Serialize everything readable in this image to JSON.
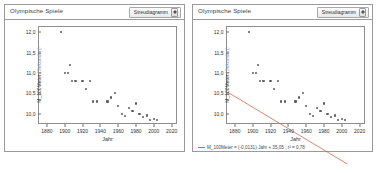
{
  "panels": [
    {
      "title": "Olympische Spiele",
      "plot_type": "Streudiagramm",
      "has_regression": false
    },
    {
      "title": "Olympische Spiele",
      "plot_type": "Streudiagramm",
      "has_regression": true,
      "equation": "M_100Meter = (-0,0131)·Jahr + 35,05 ; r² = 0,78"
    }
  ],
  "chart_data": {
    "type": "scatter",
    "title": "Olympische Spiele",
    "xlabel": "Jahr",
    "ylabel": "M_100Meter",
    "ylabel_unit": "(Sekunden)",
    "xlim": [
      1870,
      2026
    ],
    "ylim": [
      9.75,
      12.15
    ],
    "grid": false,
    "legend_position": "bottom-left",
    "xticks": [
      1880,
      1900,
      1920,
      1940,
      1960,
      1980,
      2000,
      2020
    ],
    "xticklabels": [
      "1880",
      "1900",
      "1920",
      "1940",
      "1960",
      "1980",
      "2000",
      "2020"
    ],
    "yticks": [
      10.0,
      10.5,
      11.0,
      11.5,
      12.0
    ],
    "yticklabels": [
      "10,0",
      "10,5",
      "11,0",
      "11,5",
      "12,0"
    ],
    "marker_color": "#5d5d5d",
    "line_color": "#d06a4c",
    "points": [
      {
        "x": 1896,
        "y": 12.0
      },
      {
        "x": 1900,
        "y": 11.0
      },
      {
        "x": 1904,
        "y": 11.0
      },
      {
        "x": 1906,
        "y": 11.2
      },
      {
        "x": 1908,
        "y": 10.8
      },
      {
        "x": 1912,
        "y": 10.8
      },
      {
        "x": 1920,
        "y": 10.8
      },
      {
        "x": 1924,
        "y": 10.6
      },
      {
        "x": 1928,
        "y": 10.8
      },
      {
        "x": 1932,
        "y": 10.3
      },
      {
        "x": 1936,
        "y": 10.3
      },
      {
        "x": 1948,
        "y": 10.3
      },
      {
        "x": 1952,
        "y": 10.4
      },
      {
        "x": 1956,
        "y": 10.5
      },
      {
        "x": 1960,
        "y": 10.2
      },
      {
        "x": 1964,
        "y": 10.0
      },
      {
        "x": 1968,
        "y": 9.95
      },
      {
        "x": 1972,
        "y": 10.14
      },
      {
        "x": 1976,
        "y": 10.06
      },
      {
        "x": 1980,
        "y": 10.25
      },
      {
        "x": 1984,
        "y": 9.99
      },
      {
        "x": 1988,
        "y": 9.92
      },
      {
        "x": 1992,
        "y": 9.96
      },
      {
        "x": 1996,
        "y": 9.84
      },
      {
        "x": 2000,
        "y": 9.87
      },
      {
        "x": 2004,
        "y": 9.85
      }
    ],
    "regression": {
      "slope": -0.0131,
      "intercept": 35.05,
      "r_squared": 0.78,
      "label": "M_100Meter = (-0,0131)·Jahr + 35,05 ; r² = 0,78",
      "x_start": 1872,
      "x_end": 2006
    }
  }
}
